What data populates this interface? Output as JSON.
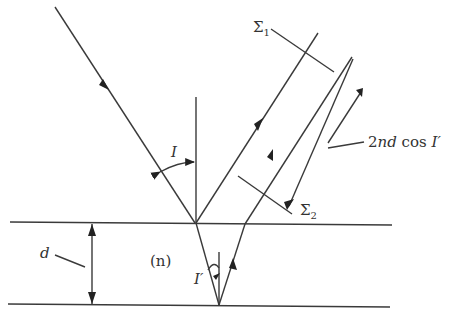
{
  "diagram": {
    "labels": {
      "sigma1": "Σ",
      "sigma1_sub": "1",
      "sigma2": "Σ",
      "sigma2_sub": "2",
      "angle_incidence": "I",
      "angle_refraction": "I′",
      "path_difference_prefix": "2",
      "path_difference_nd": "nd",
      "path_difference_cos": " cos ",
      "path_difference_angle": "I′",
      "thickness": "d",
      "refractive_index": "(n)"
    },
    "elements": [
      "incident-ray",
      "normal-line-top",
      "reflected-ray-1",
      "refracted-ray-down",
      "refracted-ray-up",
      "normal-line-bottom",
      "emergent-ray-2",
      "wavefront-sigma1",
      "wavefront-sigma2",
      "path-difference-arrow",
      "top-surface",
      "bottom-surface",
      "thickness-arrow"
    ],
    "colors": {
      "line": "#3a3a3a",
      "text": "#333333",
      "background": "#ffffff"
    }
  }
}
